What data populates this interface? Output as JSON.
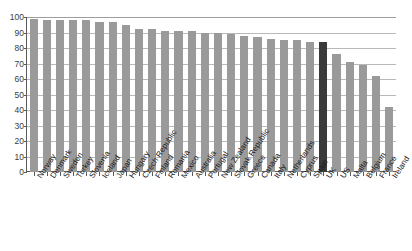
{
  "chart_data": {
    "type": "bar",
    "title": "",
    "xlabel": "",
    "ylabel": "",
    "ylim": [
      0,
      100
    ],
    "yticks": [
      100,
      90,
      80,
      70,
      60,
      50,
      40,
      30,
      20,
      10,
      0
    ],
    "grid": true,
    "legend": "none",
    "highlight_category": "UK",
    "colors": {
      "bar": "#9a9a9a",
      "highlight_bar": "#3a3a3a",
      "grid": "#b9b9b9",
      "axis": "#5a5a5a"
    },
    "categories": [
      "Norway",
      "Denmark",
      "Sweden",
      "Turkey",
      "Slovenia",
      "Iceland",
      "Japan",
      "Hungary",
      "Czech Republic",
      "Finland",
      "Romania",
      "Mexico",
      "Australia",
      "Portugal",
      "New Zealand",
      "Slovak Republic",
      "Greece",
      "Canada",
      "Italy",
      "Netherlands",
      "Cyprus",
      "Spain",
      "UK",
      "US",
      "Malta",
      "Belgium",
      "France",
      "Ireland"
    ],
    "values": [
      99,
      98,
      98,
      98,
      98,
      97,
      97,
      95,
      92,
      92,
      91,
      91,
      91,
      90,
      90,
      89,
      88,
      87,
      86,
      85,
      85,
      84,
      84,
      76,
      71,
      69,
      62,
      42
    ]
  }
}
